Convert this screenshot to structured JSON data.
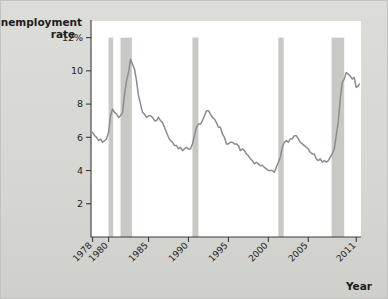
{
  "chart_data": {
    "type": "line",
    "title": "",
    "ylabel_line1": "Unemployment",
    "ylabel_line2": "rate",
    "xlabel": "Year",
    "ylim": [
      0,
      13
    ],
    "xlim": [
      1977.8,
      2011.6
    ],
    "grid": false,
    "legend": "none",
    "yticks": [
      {
        "value": 12,
        "label": "12%"
      },
      {
        "value": 10,
        "label": "10"
      },
      {
        "value": 8,
        "label": "8"
      },
      {
        "value": 6,
        "label": "6"
      },
      {
        "value": 4,
        "label": "4"
      },
      {
        "value": 2,
        "label": "2"
      }
    ],
    "xticks": [
      {
        "value": 1978,
        "label": "1978"
      },
      {
        "value": 1980,
        "label": "1980"
      },
      {
        "value": 1985,
        "label": "1985"
      },
      {
        "value": 1990,
        "label": "1990"
      },
      {
        "value": 1995,
        "label": "1995"
      },
      {
        "value": 2000,
        "label": "2000"
      },
      {
        "value": 2005,
        "label": "2005"
      },
      {
        "value": 2011,
        "label": "2011"
      }
    ],
    "bands": [
      {
        "name": "recession-1980",
        "start": 1980.0,
        "end": 1980.58
      },
      {
        "name": "recession-1981-82",
        "start": 1981.5,
        "end": 1982.92
      },
      {
        "name": "recession-1990-91",
        "start": 1990.5,
        "end": 1991.25
      },
      {
        "name": "recession-2001",
        "start": 2001.25,
        "end": 2001.92
      },
      {
        "name": "recession-2007-09",
        "start": 2007.92,
        "end": 2009.5
      }
    ],
    "band_top": 12,
    "series": [
      {
        "name": "Unemployment rate",
        "color": "#8c8c8c",
        "x": [
          1978.0,
          1978.25,
          1978.5,
          1978.75,
          1979.0,
          1979.25,
          1979.5,
          1979.75,
          1980.0,
          1980.25,
          1980.5,
          1980.75,
          1981.0,
          1981.25,
          1981.5,
          1981.75,
          1982.0,
          1982.25,
          1982.5,
          1982.75,
          1983.0,
          1983.25,
          1983.5,
          1983.75,
          1984.0,
          1984.25,
          1984.5,
          1984.75,
          1985.0,
          1985.25,
          1985.5,
          1985.75,
          1986.0,
          1986.25,
          1986.5,
          1986.75,
          1987.0,
          1987.25,
          1987.5,
          1987.75,
          1988.0,
          1988.25,
          1988.5,
          1988.75,
          1989.0,
          1989.25,
          1989.5,
          1989.75,
          1990.0,
          1990.25,
          1990.5,
          1990.75,
          1991.0,
          1991.25,
          1991.5,
          1991.75,
          1992.0,
          1992.25,
          1992.5,
          1992.75,
          1993.0,
          1993.25,
          1993.5,
          1993.75,
          1994.0,
          1994.25,
          1994.5,
          1994.75,
          1995.0,
          1995.25,
          1995.5,
          1995.75,
          1996.0,
          1996.25,
          1996.5,
          1996.75,
          1997.0,
          1997.25,
          1997.5,
          1997.75,
          1998.0,
          1998.25,
          1998.5,
          1998.75,
          1999.0,
          1999.25,
          1999.5,
          1999.75,
          2000.0,
          2000.25,
          2000.5,
          2000.75,
          2001.0,
          2001.25,
          2001.5,
          2001.75,
          2002.0,
          2002.25,
          2002.5,
          2002.75,
          2003.0,
          2003.25,
          2003.5,
          2003.75,
          2004.0,
          2004.25,
          2004.5,
          2004.75,
          2005.0,
          2005.25,
          2005.5,
          2005.75,
          2006.0,
          2006.25,
          2006.5,
          2006.75,
          2007.0,
          2007.25,
          2007.5,
          2007.75,
          2008.0,
          2008.25,
          2008.5,
          2008.75,
          2009.0,
          2009.25,
          2009.5,
          2009.75,
          2010.0,
          2010.25,
          2010.5,
          2010.75,
          2011.0,
          2011.25,
          2011.4
        ],
        "y": [
          6.3,
          6.1,
          6.0,
          5.8,
          5.9,
          5.7,
          5.8,
          5.9,
          6.3,
          7.3,
          7.7,
          7.5,
          7.4,
          7.2,
          7.3,
          7.5,
          8.6,
          9.4,
          9.9,
          10.7,
          10.4,
          10.1,
          9.4,
          8.5,
          8.0,
          7.5,
          7.4,
          7.2,
          7.3,
          7.3,
          7.2,
          7.0,
          7.0,
          7.2,
          7.0,
          6.9,
          6.6,
          6.3,
          6.0,
          5.8,
          5.7,
          5.5,
          5.5,
          5.3,
          5.4,
          5.2,
          5.3,
          5.4,
          5.3,
          5.3,
          5.6,
          6.1,
          6.6,
          6.8,
          6.8,
          7.0,
          7.3,
          7.6,
          7.6,
          7.4,
          7.2,
          7.1,
          6.9,
          6.6,
          6.6,
          6.2,
          6.0,
          5.6,
          5.6,
          5.7,
          5.7,
          5.6,
          5.6,
          5.5,
          5.2,
          5.3,
          5.2,
          5.0,
          4.9,
          4.7,
          4.6,
          4.4,
          4.5,
          4.4,
          4.3,
          4.3,
          4.2,
          4.1,
          4.0,
          4.0,
          4.0,
          3.9,
          4.2,
          4.5,
          4.8,
          5.4,
          5.7,
          5.8,
          5.7,
          5.9,
          5.9,
          6.1,
          6.1,
          5.9,
          5.7,
          5.6,
          5.5,
          5.4,
          5.3,
          5.1,
          5.0,
          5.0,
          4.7,
          4.6,
          4.7,
          4.5,
          4.6,
          4.5,
          4.6,
          4.8,
          5.0,
          5.3,
          6.1,
          6.9,
          8.3,
          9.3,
          9.5,
          9.9,
          9.8,
          9.7,
          9.5,
          9.6,
          9.0,
          9.1,
          9.2
        ]
      }
    ]
  }
}
